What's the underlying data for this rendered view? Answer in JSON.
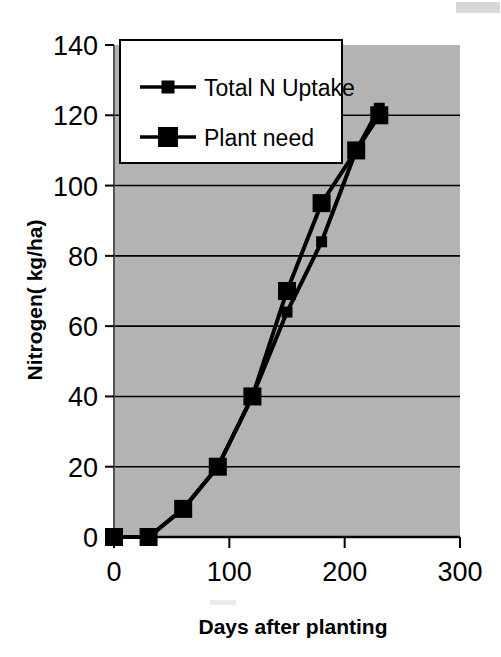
{
  "chart_data": {
    "type": "line",
    "title": "",
    "xlabel": "Days after planting",
    "ylabel": "Nitrogen( kg/ha)",
    "xlim": [
      0,
      300
    ],
    "ylim": [
      0,
      140
    ],
    "xticks": [
      "0",
      "100",
      "200",
      "300"
    ],
    "yticks": [
      "0",
      "20",
      "40",
      "60",
      "80",
      "100",
      "120",
      "140"
    ],
    "xtick_values": [
      0,
      100,
      200,
      300
    ],
    "ytick_values": [
      0,
      20,
      40,
      60,
      80,
      100,
      120,
      140
    ],
    "grid": "horizontal",
    "plot_background": "#b3b3b3",
    "line_color": "#000000",
    "legend_position": "upper-left-inside",
    "legend_background": "#ffffff",
    "x": [
      0,
      30,
      60,
      90,
      120,
      150,
      180,
      210,
      230
    ],
    "series": [
      {
        "name": "Total N Uptake",
        "marker": "small-square",
        "values": [
          0,
          0,
          8,
          20,
          40,
          64,
          84,
          110,
          122
        ]
      },
      {
        "name": "Plant need",
        "marker": "large-square",
        "values": [
          0,
          0,
          8,
          20,
          40,
          70,
          95,
          110,
          120
        ]
      }
    ]
  },
  "legend": {
    "entries": [
      {
        "label": "Total N Uptake"
      },
      {
        "label": "Plant need"
      }
    ]
  },
  "axes": {
    "y_title": "Nitrogen( kg/ha)",
    "x_title": "Days after planting"
  }
}
